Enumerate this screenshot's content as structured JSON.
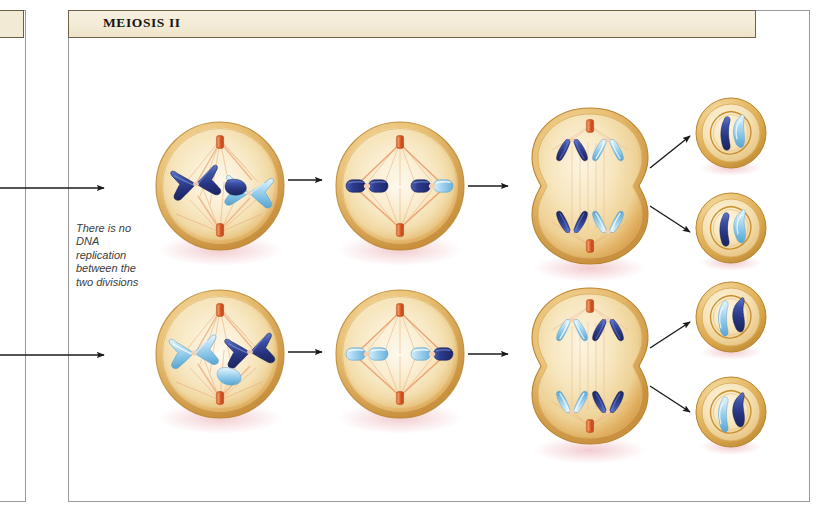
{
  "page": {
    "width": 823,
    "height": 511,
    "background": "#ffffff"
  },
  "left_panel": {
    "name": "adjacent-panel-cutoff",
    "banner_label": ""
  },
  "main_panel": {
    "banner_title": "MEIOSIS II",
    "banner_color": "#f2ead5",
    "border_color": "#9a9a9a"
  },
  "annotation": {
    "text": "There is no DNA replication between the two divisions",
    "lines": [
      "There is",
      "no DNA",
      "replication",
      "between",
      "the two",
      "divisions"
    ],
    "style": "italic"
  },
  "colors": {
    "cell_fill_outer": "#e0ad5a",
    "cell_fill_inner": "#f7e7c0",
    "cell_rim": "#caa14b",
    "nucleus_rim": "#d9a952",
    "chromosome_dark": "#2b3f8f",
    "chromosome_light": "#a8d4ee",
    "chromosome_mid": "#4e6fc0",
    "centriole": "#e2622c",
    "spindle_fiber": "#e79a6a",
    "arrow": "#1a1a1a",
    "banner_text": "#151515",
    "annotation_text": "#3b3b3b"
  },
  "diagram": {
    "title": "MEIOSIS II",
    "rows": [
      {
        "row_name": "meiosis-ii-upper-cell-lineage",
        "stages": [
          {
            "stage_name": "prophase-ii",
            "label": "",
            "cell_shape": "round",
            "chromosomes": [
              {
                "color": "dark-blue",
                "form": "x-shaped-duplicated"
              },
              {
                "color": "light-blue",
                "form": "x-shaped-duplicated"
              }
            ],
            "centrioles": 2,
            "spindle": true
          },
          {
            "stage_name": "metaphase-ii",
            "label": "",
            "cell_shape": "round",
            "chromosomes": [
              {
                "color": "dark-blue",
                "form": "aligned-at-equator"
              },
              {
                "color": "light-blue",
                "form": "aligned-at-equator"
              }
            ],
            "centrioles": 2,
            "spindle": true
          },
          {
            "stage_name": "anaphase-telophase-ii",
            "label": "",
            "cell_shape": "pinched-cleavage-furrow",
            "chromosomes": [
              {
                "color": "dark-blue",
                "form": "chromatid-pulled-to-pole"
              },
              {
                "color": "light-blue",
                "form": "chromatid-pulled-to-pole"
              }
            ],
            "centrioles": 2,
            "spindle": true
          }
        ],
        "daughter_cells": [
          {
            "cell_name": "haploid-daughter-cell-1",
            "chromosomes": [
              "dark-blue",
              "light-blue"
            ]
          },
          {
            "cell_name": "haploid-daughter-cell-2",
            "chromosomes": [
              "dark-blue",
              "light-blue"
            ]
          }
        ]
      },
      {
        "row_name": "meiosis-ii-lower-cell-lineage",
        "stages": [
          {
            "stage_name": "prophase-ii",
            "label": "",
            "cell_shape": "round",
            "chromosomes": [
              {
                "color": "light-blue",
                "form": "x-shaped-duplicated"
              },
              {
                "color": "dark-blue",
                "form": "x-shaped-duplicated"
              }
            ],
            "centrioles": 2,
            "spindle": true
          },
          {
            "stage_name": "metaphase-ii",
            "label": "",
            "cell_shape": "round",
            "chromosomes": [
              {
                "color": "light-blue",
                "form": "aligned-at-equator"
              },
              {
                "color": "dark-blue",
                "form": "aligned-at-equator"
              }
            ],
            "centrioles": 2,
            "spindle": true
          },
          {
            "stage_name": "anaphase-telophase-ii",
            "label": "",
            "cell_shape": "pinched-cleavage-furrow",
            "chromosomes": [
              {
                "color": "light-blue",
                "form": "chromatid-pulled-to-pole"
              },
              {
                "color": "dark-blue",
                "form": "chromatid-pulled-to-pole"
              }
            ],
            "centrioles": 2,
            "spindle": true
          }
        ],
        "daughter_cells": [
          {
            "cell_name": "haploid-daughter-cell-3",
            "chromosomes": [
              "light-blue",
              "dark-blue"
            ]
          },
          {
            "cell_name": "haploid-daughter-cell-4",
            "chromosomes": [
              "light-blue",
              "dark-blue"
            ]
          }
        ]
      }
    ],
    "arrows": {
      "incoming_from_meiosis_i": 2,
      "between_stages": 4,
      "to_daughter_cells": 4
    }
  }
}
